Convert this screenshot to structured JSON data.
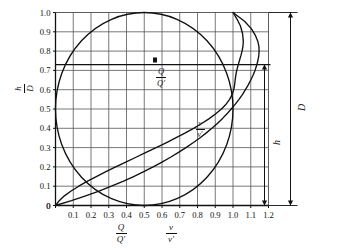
{
  "chart_data": {
    "type": "line",
    "title": "",
    "xlabel": "Q/Q'   v/v'",
    "ylabel": "h/D",
    "xlim": [
      0,
      1.2
    ],
    "ylim": [
      0,
      1.0
    ],
    "grid": true,
    "legend": "in-plot curve labels",
    "x_ticks": [
      "0",
      "0.1",
      "0.2",
      "0.3",
      "0.4",
      "0.5",
      "0.6",
      "0.7",
      "0.8",
      "0.9",
      "1.0",
      "1.1",
      "1.2"
    ],
    "x_tick_values": [
      0,
      0.1,
      0.2,
      0.3,
      0.4,
      0.5,
      0.6,
      0.7,
      0.8,
      0.9,
      1.0,
      1.1,
      1.2
    ],
    "y_ticks": [
      "0",
      "0.1",
      "0.2",
      "0.3",
      "0.4",
      "0.5",
      "0.6",
      "0.7",
      "0.8",
      "0.9",
      "1.0"
    ],
    "y_tick_values": [
      0,
      0.1,
      0.2,
      0.3,
      0.4,
      0.5,
      0.6,
      0.7,
      0.8,
      0.9,
      1.0
    ],
    "series": [
      {
        "name": "pipe-section-circle",
        "label": "",
        "description": "Circular pipe cross-section outline, centre (0.5, 0.5), radius 0.5 in axis units",
        "x": [
          0.5,
          0.413,
          0.33,
          0.255,
          0.19,
          0.134,
          0.09,
          0.057,
          0.035,
          0.026,
          0.03,
          0.048,
          0.079,
          0.122,
          0.175,
          0.237,
          0.307,
          0.381,
          0.458,
          0.536,
          0.613,
          0.686,
          0.753,
          0.812,
          0.861,
          0.899,
          0.925,
          0.938,
          0.938,
          0.925,
          0.899,
          0.861,
          0.812,
          0.753,
          0.686,
          0.613,
          0.536,
          0.458,
          0.381,
          0.307,
          0.237,
          0.175,
          0.122,
          0.079,
          0.048,
          0.03,
          0.026,
          0.035,
          0.057,
          0.09,
          0.134,
          0.19,
          0.255,
          0.33,
          0.413,
          0.5
        ],
        "y": [
          1.0,
          0.996,
          0.984,
          0.964,
          0.937,
          0.903,
          0.862,
          0.816,
          0.765,
          0.711,
          0.655,
          0.597,
          0.539,
          0.482,
          0.427,
          0.375,
          0.327,
          0.284,
          0.247,
          0.216,
          0.192,
          0.176,
          0.167,
          0.166,
          0.173,
          0.187,
          0.208,
          0.236,
          0.764,
          0.792,
          0.813,
          0.827,
          0.834,
          0.833,
          0.824,
          0.808,
          0.784,
          0.753,
          0.716,
          0.673,
          0.625,
          0.573,
          0.518,
          0.461,
          0.403,
          0.345,
          0.289,
          0.235,
          0.184,
          0.138,
          0.097,
          0.063,
          0.036,
          0.016,
          0.004,
          0.0
        ]
      },
      {
        "name": "discharge-ratio-curve",
        "label": "Q/Q'",
        "description": "Ratio of partial-flow discharge to full-flow discharge vs relative depth h/D",
        "x": [
          0.0,
          0.021,
          0.05,
          0.088,
          0.131,
          0.178,
          0.23,
          0.284,
          0.339,
          0.396,
          0.453,
          0.51,
          0.567,
          0.623,
          0.677,
          0.729,
          0.778,
          0.824,
          0.866,
          0.903,
          0.935,
          0.961,
          0.981,
          0.995,
          1.004,
          1.009,
          1.012,
          1.016,
          1.021,
          1.028,
          1.036,
          1.044,
          1.051,
          1.056,
          1.058,
          1.054,
          1.042,
          1.02,
          1.0
        ],
        "y": [
          0.0,
          0.025,
          0.05,
          0.075,
          0.1,
          0.125,
          0.15,
          0.175,
          0.2,
          0.225,
          0.25,
          0.275,
          0.3,
          0.325,
          0.35,
          0.375,
          0.4,
          0.425,
          0.45,
          0.475,
          0.5,
          0.525,
          0.55,
          0.575,
          0.6,
          0.625,
          0.65,
          0.675,
          0.7,
          0.725,
          0.75,
          0.775,
          0.8,
          0.825,
          0.85,
          0.89,
          0.93,
          0.97,
          1.0
        ]
      },
      {
        "name": "velocity-ratio-curve",
        "label": "v/v'",
        "description": "Ratio of partial-flow velocity to full-flow velocity vs relative depth h/D",
        "x": [
          0.0,
          0.09,
          0.17,
          0.245,
          0.315,
          0.38,
          0.44,
          0.497,
          0.55,
          0.6,
          0.648,
          0.693,
          0.735,
          0.775,
          0.813,
          0.848,
          0.881,
          0.912,
          0.94,
          0.966,
          0.99,
          1.013,
          1.034,
          1.053,
          1.07,
          1.086,
          1.1,
          1.113,
          1.124,
          1.133,
          1.14,
          1.145,
          1.147,
          1.146,
          1.14,
          1.127,
          1.104,
          1.065,
          1.0
        ],
        "y": [
          0.0,
          0.025,
          0.05,
          0.075,
          0.1,
          0.125,
          0.15,
          0.175,
          0.2,
          0.225,
          0.25,
          0.275,
          0.3,
          0.325,
          0.35,
          0.375,
          0.4,
          0.425,
          0.45,
          0.475,
          0.5,
          0.525,
          0.55,
          0.575,
          0.6,
          0.625,
          0.65,
          0.675,
          0.7,
          0.725,
          0.75,
          0.775,
          0.8,
          0.825,
          0.85,
          0.88,
          0.915,
          0.955,
          1.0
        ]
      }
    ],
    "reference_lines": [
      {
        "name": "depth-reference-line",
        "orientation": "horizontal",
        "value": 0.73,
        "label": ""
      }
    ],
    "annotations": [
      {
        "name": "pipe-diameter-dimension",
        "label": "D",
        "from": 0.0,
        "to": 1.0
      },
      {
        "name": "flow-depth-dimension",
        "label": "h",
        "from": 0.0,
        "to": 0.73
      }
    ]
  },
  "axes": {
    "y_axis_label": {
      "numerator": "h",
      "denominator": "D"
    },
    "x_axis_label_left": {
      "numerator": "Q",
      "denominator": "Q'"
    },
    "x_axis_label_right": {
      "numerator": "v",
      "denominator": "v'"
    }
  },
  "plot_labels": {
    "discharge": {
      "numerator": "Q",
      "denominator": "Q'"
    },
    "velocity": {
      "numerator": "v",
      "denominator": "v'"
    },
    "dimension_d": "D",
    "dimension_h": "h"
  },
  "colors": {
    "background": "#ffffff",
    "curve": "#111111",
    "grid": "#555555",
    "axis": "#111111",
    "text": "#111111"
  }
}
